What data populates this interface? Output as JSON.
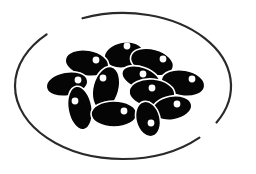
{
  "image": {
    "description": "Icon illustration of a plate with black beans",
    "colors": {
      "background": "#ffffff",
      "plate_outline": "#2a2a2a",
      "bean_fill": "#050505",
      "bean_outline": "#ffffff",
      "highlight": "#ffffff"
    },
    "plate": {
      "cx": 123,
      "cy": 86,
      "rx": 108,
      "ry": 73
    },
    "beans": [
      {
        "cx": 124,
        "cy": 55,
        "rx": 20,
        "ry": 13,
        "rot": -10,
        "hx": 127,
        "hy": 46
      },
      {
        "cx": 87,
        "cy": 63,
        "rx": 22,
        "ry": 13,
        "rot": 10,
        "hx": 96,
        "hy": 60
      },
      {
        "cx": 152,
        "cy": 62,
        "rx": 22,
        "ry": 13,
        "rot": 15,
        "hx": 163,
        "hy": 59
      },
      {
        "cx": 67,
        "cy": 84,
        "rx": 21,
        "ry": 12,
        "rot": -10,
        "hx": 78,
        "hy": 80
      },
      {
        "cx": 141,
        "cy": 78,
        "rx": 20,
        "ry": 11,
        "rot": 20,
        "hx": 143,
        "hy": 74
      },
      {
        "cx": 183,
        "cy": 83,
        "rx": 22,
        "ry": 13,
        "rot": 10,
        "hx": 192,
        "hy": 79
      },
      {
        "cx": 106,
        "cy": 88,
        "rx": 13,
        "ry": 22,
        "rot": 15,
        "hx": 103,
        "hy": 78
      },
      {
        "cx": 80,
        "cy": 108,
        "rx": 12,
        "ry": 22,
        "rot": -10,
        "hx": 75,
        "hy": 101
      },
      {
        "cx": 152,
        "cy": 93,
        "rx": 23,
        "ry": 14,
        "rot": 5,
        "hx": 152,
        "hy": 88
      },
      {
        "cx": 172,
        "cy": 108,
        "rx": 20,
        "ry": 12,
        "rot": -10,
        "hx": 177,
        "hy": 104
      },
      {
        "cx": 114,
        "cy": 114,
        "rx": 23,
        "ry": 13,
        "rot": 0,
        "hx": 124,
        "hy": 111
      },
      {
        "cx": 148,
        "cy": 119,
        "rx": 12,
        "ry": 18,
        "rot": -15,
        "hx": 151,
        "hy": 123
      }
    ]
  }
}
